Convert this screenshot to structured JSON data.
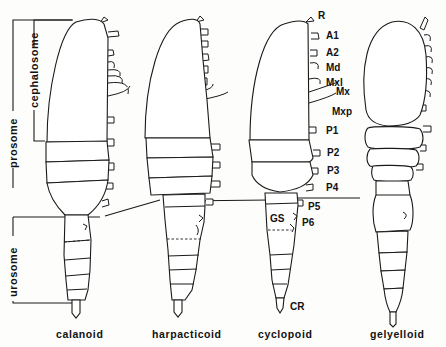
{
  "figure": {
    "regions": {
      "prosome": "prosome",
      "cephalosome": "cephalosome",
      "urosome": "urosome"
    },
    "appendage_labels": [
      "R",
      "A1",
      "A2",
      "Md",
      "Mxl",
      "Mx",
      "Mxp",
      "P1",
      "P2",
      "P3",
      "P4",
      "P5",
      "P6",
      "GS",
      "CR"
    ],
    "labels": {
      "R": "R",
      "A1": "A1",
      "A2": "A2",
      "Md": "Md",
      "Mxl": "Mxl",
      "Mx": "Mx",
      "Mxp": "Mxp",
      "P1": "P1",
      "P2": "P2",
      "P3": "P3",
      "P4": "P4",
      "P5": "P5",
      "P6": "P6",
      "GS": "GS",
      "CR": "CR"
    },
    "taxa": [
      "calanoid",
      "harpacticoid",
      "cyclopoid",
      "gelyelloid"
    ],
    "colors": {
      "line": "#1a1a1a",
      "background": "#fdfdfc"
    }
  }
}
